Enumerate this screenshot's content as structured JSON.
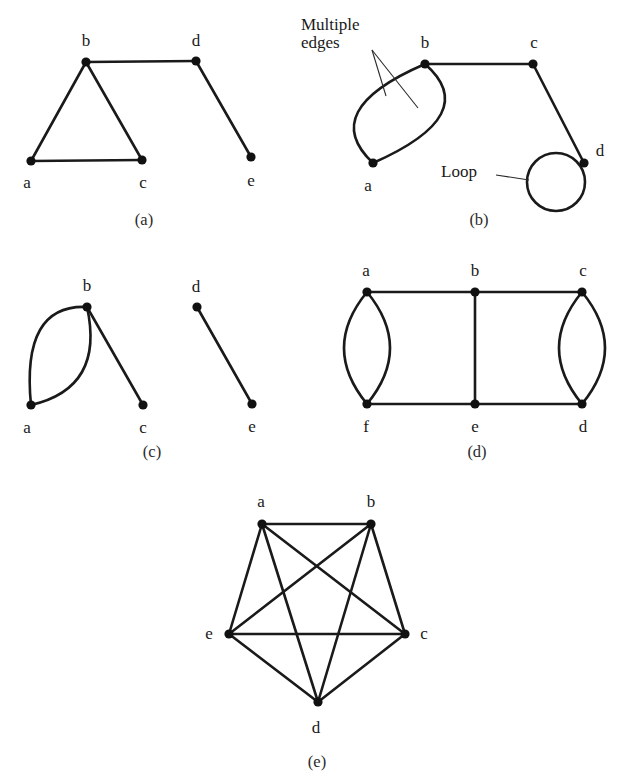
{
  "figure": {
    "background_color": "#ffffff",
    "ink_color": "#1a1a1a",
    "panels": [
      {
        "id": "a",
        "caption": "(a)",
        "caption_pos": [
          144,
          220
        ],
        "vertices": [
          {
            "label": "a",
            "x": 31,
            "y": 161,
            "label_x": 27,
            "label_y": 182
          },
          {
            "label": "b",
            "x": 86,
            "y": 62,
            "label_x": 86,
            "label_y": 40
          },
          {
            "label": "c",
            "x": 142,
            "y": 160,
            "label_x": 143,
            "label_y": 182
          },
          {
            "label": "d",
            "x": 196,
            "y": 61,
            "label_x": 196,
            "label_y": 40
          },
          {
            "label": "e",
            "x": 251,
            "y": 157,
            "label_x": 251,
            "label_y": 180
          }
        ],
        "edges": [
          {
            "from": "a",
            "to": "b",
            "type": "line"
          },
          {
            "from": "b",
            "to": "c",
            "type": "line"
          },
          {
            "from": "a",
            "to": "c",
            "type": "line"
          },
          {
            "from": "b",
            "to": "d",
            "type": "line"
          },
          {
            "from": "d",
            "to": "e",
            "type": "line"
          }
        ]
      },
      {
        "id": "b",
        "caption": "(b)",
        "caption_pos": [
          479,
          220
        ],
        "vertices": [
          {
            "label": "a",
            "x": 373,
            "y": 163,
            "label_x": 368,
            "label_y": 185
          },
          {
            "label": "b",
            "x": 425,
            "y": 64,
            "label_x": 425,
            "label_y": 42
          },
          {
            "label": "c",
            "x": 533,
            "y": 64,
            "label_x": 534,
            "label_y": 42
          },
          {
            "label": "d",
            "x": 584,
            "y": 163,
            "label_x": 600,
            "label_y": 150
          }
        ],
        "edges": [
          {
            "from": "a",
            "to": "b",
            "type": "curve",
            "cx": 358,
            "cy": 112
          },
          {
            "from": "a",
            "to": "b",
            "type": "curve",
            "cx": 441,
            "cy": 114
          },
          {
            "from": "b",
            "to": "c",
            "type": "line"
          },
          {
            "from": "c",
            "to": "d",
            "type": "line"
          },
          {
            "from": "d",
            "to": "d",
            "type": "loop",
            "cx": 556,
            "cy": 182,
            "r": 29
          }
        ],
        "annotations": [
          {
            "text": "Multiple\nedges",
            "x": 301,
            "y": 16,
            "leaders": [
              {
                "x1": 372,
                "y1": 50,
                "x2": 386,
                "y2": 96
              },
              {
                "x1": 372,
                "y1": 50,
                "x2": 418,
                "y2": 108
              }
            ]
          },
          {
            "text": "Loop",
            "x": 441,
            "y": 163,
            "leaders": [
              {
                "x1": 496,
                "y1": 175,
                "x2": 529,
                "y2": 180
              }
            ]
          }
        ]
      },
      {
        "id": "c",
        "caption": "(c)",
        "caption_pos": [
          152,
          452
        ],
        "vertices": [
          {
            "label": "a",
            "x": 31,
            "y": 405,
            "label_x": 27,
            "label_y": 427
          },
          {
            "label": "b",
            "x": 87,
            "y": 307,
            "label_x": 87,
            "label_y": 285
          },
          {
            "label": "c",
            "x": 143,
            "y": 405,
            "label_x": 143,
            "label_y": 427
          },
          {
            "label": "d",
            "x": 197,
            "y": 307,
            "label_x": 196,
            "label_y": 286
          },
          {
            "label": "e",
            "x": 252,
            "y": 404,
            "label_x": 252,
            "label_y": 426
          }
        ],
        "edges": [
          {
            "from": "a",
            "to": "b",
            "type": "curve",
            "cx": 40,
            "cy": 330
          },
          {
            "from": "a",
            "to": "b",
            "type": "curve",
            "cx": 82,
            "cy": 372
          },
          {
            "from": "b",
            "to": "c",
            "type": "line"
          },
          {
            "from": "d",
            "to": "e",
            "type": "line"
          }
        ]
      },
      {
        "id": "d",
        "caption": "(d)",
        "caption_pos": [
          477,
          452
        ],
        "vertices": [
          {
            "label": "a",
            "x": 367,
            "y": 292,
            "label_x": 366,
            "label_y": 270
          },
          {
            "label": "b",
            "x": 475,
            "y": 292,
            "label_x": 475,
            "label_y": 270
          },
          {
            "label": "c",
            "x": 582,
            "y": 292,
            "label_x": 583,
            "label_y": 270
          },
          {
            "label": "f",
            "x": 367,
            "y": 404,
            "label_x": 366,
            "label_y": 426
          },
          {
            "label": "e",
            "x": 475,
            "y": 404,
            "label_x": 475,
            "label_y": 426
          },
          {
            "label": "d",
            "x": 582,
            "y": 404,
            "label_x": 583,
            "label_y": 426
          }
        ],
        "edges": [
          {
            "from": "a",
            "to": "b",
            "type": "line"
          },
          {
            "from": "b",
            "to": "c",
            "type": "line"
          },
          {
            "from": "f",
            "to": "e",
            "type": "line"
          },
          {
            "from": "e",
            "to": "d",
            "type": "line"
          },
          {
            "from": "b",
            "to": "e",
            "type": "line"
          },
          {
            "from": "a",
            "to": "f",
            "type": "curve",
            "cx": 344,
            "cy": 348
          },
          {
            "from": "a",
            "to": "f",
            "type": "curve",
            "cx": 390,
            "cy": 348
          },
          {
            "from": "c",
            "to": "d",
            "type": "curve",
            "cx": 559,
            "cy": 348
          },
          {
            "from": "c",
            "to": "d",
            "type": "curve",
            "cx": 605,
            "cy": 348
          }
        ]
      },
      {
        "id": "e",
        "caption": "(e)",
        "caption_pos": [
          317,
          762
        ],
        "vertices": [
          {
            "label": "a",
            "x": 262,
            "y": 524,
            "label_x": 261,
            "label_y": 501
          },
          {
            "label": "b",
            "x": 371,
            "y": 524,
            "label_x": 371,
            "label_y": 501
          },
          {
            "label": "c",
            "x": 405,
            "y": 634,
            "label_x": 424,
            "label_y": 633
          },
          {
            "label": "d",
            "x": 318,
            "y": 702,
            "label_x": 316,
            "label_y": 727
          },
          {
            "label": "e",
            "x": 229,
            "y": 634,
            "label_x": 209,
            "label_y": 633
          }
        ],
        "edges": [
          {
            "from": "a",
            "to": "b",
            "type": "line"
          },
          {
            "from": "a",
            "to": "c",
            "type": "line"
          },
          {
            "from": "a",
            "to": "d",
            "type": "line"
          },
          {
            "from": "a",
            "to": "e",
            "type": "line"
          },
          {
            "from": "b",
            "to": "c",
            "type": "line"
          },
          {
            "from": "b",
            "to": "d",
            "type": "line"
          },
          {
            "from": "b",
            "to": "e",
            "type": "line"
          },
          {
            "from": "c",
            "to": "d",
            "type": "line"
          },
          {
            "from": "c",
            "to": "e",
            "type": "line"
          },
          {
            "from": "d",
            "to": "e",
            "type": "line"
          }
        ]
      }
    ]
  }
}
